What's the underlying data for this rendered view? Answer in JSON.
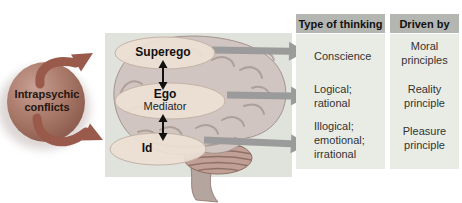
{
  "conflict_node": {
    "label": "Intrapsychic\nconflicts"
  },
  "brain_labels": {
    "superego": "Superego",
    "ego": "Ego",
    "ego_role": "Mediator",
    "id": "Id"
  },
  "table": {
    "columns": [
      {
        "header": "Type of thinking",
        "rows": [
          "Conscience",
          "Logical;\nrational",
          "Illogical;\nemotional;\nirrational"
        ]
      },
      {
        "header": "Driven by",
        "rows": [
          "Moral\nprinciples",
          "Reality\nprinciple",
          "Pleasure\nprinciple"
        ]
      }
    ]
  },
  "icons": {
    "conflict_cycle_arrows": "two curved arrows circling the conflict sphere toward the brain",
    "flow_arrows": "three gray right-pointing arrows from brain levels to table rows",
    "double_arrows": "black double-headed vertical arrows between Superego–Ego and Ego–Id"
  },
  "colors": {
    "conflict-sphere-light": "#c8a094",
    "conflict-sphere-mid": "#a87868",
    "conflict-sphere-dark": "#8b5a4d",
    "conflict-arrow": "#9a5a4b",
    "flow-arrow": "#9b9b9b",
    "panel-bg": "#e0e3db",
    "header-bg": "#b4b6b2",
    "column-bg": "#e9ece5",
    "brain-fill": "#d1c5c1",
    "brain-line": "#a2938e",
    "cerebellum-fill": "#c0a096",
    "cerebellum-line": "#8d6f64",
    "stem-fill": "#b5a59f",
    "oval-fill": "#eddfd4",
    "label-text": "#111111",
    "body-text": "#333333",
    "conflict-text": "#241510"
  }
}
